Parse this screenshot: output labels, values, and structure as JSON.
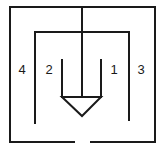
{
  "diagram": {
    "type": "nested-enclosure schematic",
    "stroke_color": "#1a1a1a",
    "background": "#ffffff",
    "labels": [
      {
        "id": "4",
        "text": "4",
        "region": "outer-left"
      },
      {
        "id": "2",
        "text": "2",
        "region": "inner-left"
      },
      {
        "id": "1",
        "text": "1",
        "region": "inner-right"
      },
      {
        "id": "3",
        "text": "3",
        "region": "outer-right"
      }
    ],
    "elements": {
      "outer_enclosure": "outer rectangle with gap at bottom center",
      "inner_enclosure": "inner inverted-U, open at bottom",
      "center_stem": "vertical line from top down to triangle",
      "cup": "two short verticals with downward-pointing triangle"
    }
  }
}
